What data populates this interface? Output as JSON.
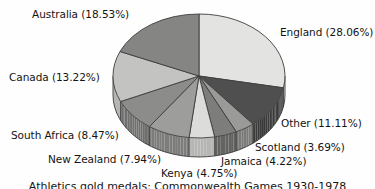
{
  "figure": {
    "background_color": "#fefefe",
    "text_color": "#141414",
    "caption_partial": "Athletics gold medals: Commonwealth Games 1930-1978"
  },
  "chart_data": {
    "type": "pie",
    "title": "",
    "subtitle": "",
    "xlabel": "",
    "ylabel": "",
    "three_d": true,
    "grid": false,
    "legend_position": "none",
    "label_format": "{name} ({value}%)",
    "start_angle_deg": 90,
    "direction": "clockwise",
    "total_percent": 99.99,
    "categories": [
      "England",
      "Other",
      "Scotland",
      "Jamaica",
      "Kenya",
      "New Zealand",
      "South Africa",
      "Canada",
      "Australia"
    ],
    "values": [
      28.06,
      11.11,
      3.69,
      4.22,
      4.75,
      7.94,
      8.47,
      13.22,
      18.53
    ],
    "slices": [
      {
        "name": "England",
        "value": 28.06,
        "label": "England (28.06%)",
        "color": "#e3e3e1",
        "side_color": "#bfbfbd"
      },
      {
        "name": "Other",
        "value": 11.11,
        "label": "Other (11.11%)",
        "color": "#4f4f4f",
        "side_color": "#3a3a3a"
      },
      {
        "name": "Scotland",
        "value": 3.69,
        "label": "Scotland (3.69%)",
        "color": "#9a9a98",
        "side_color": "#7b7b79"
      },
      {
        "name": "Jamaica",
        "value": 4.22,
        "label": "Jamaica (4.22%)",
        "color": "#7d7d7b",
        "side_color": "#636361"
      },
      {
        "name": "Kenya",
        "value": 4.75,
        "label": "Kenya (4.75%)",
        "color": "#dcdcda",
        "side_color": "#b6b6b4"
      },
      {
        "name": "New Zealand",
        "value": 7.94,
        "label": "New Zealand (7.94%)",
        "color": "#9d9d9b",
        "side_color": "#7d7d7b"
      },
      {
        "name": "South Africa",
        "value": 8.47,
        "label": "South Africa (8.47%)",
        "color": "#8c8c8a",
        "side_color": "#6f6f6d"
      },
      {
        "name": "Canada",
        "value": 13.22,
        "label": "Canada (13.22%)",
        "color": "#c3c3c1",
        "side_color": "#a0a09e"
      },
      {
        "name": "Australia",
        "value": 18.53,
        "label": "Australia (18.53%)",
        "color": "#858583",
        "side_color": "#6a6a68"
      }
    ]
  },
  "labels": {
    "australia": "Australia (18.53%)",
    "england": "England (28.06%)",
    "canada": "Canada (13.22%)",
    "other": "Other (11.11%)",
    "south_africa": "South Africa (8.47%)",
    "scotland": "Scotland (3.69%)",
    "new_zealand": "New Zealand (7.94%)",
    "jamaica": "Jamaica (4.22%)",
    "kenya": "Kenya (4.75%)"
  },
  "caption": {
    "text": "Athletics gold medals: Commonwealth Games 1930-1978"
  }
}
